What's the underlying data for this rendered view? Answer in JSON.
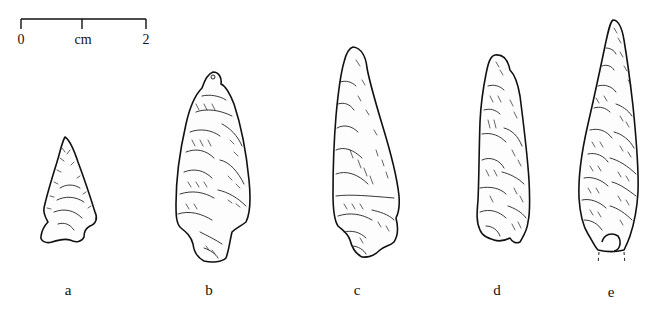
{
  "scale_bar": {
    "start_label": "0",
    "unit_label": "cm",
    "end_label": "2"
  },
  "artifacts": [
    {
      "id": "a",
      "label": "a",
      "type": "side-notched point"
    },
    {
      "id": "b",
      "label": "b",
      "type": "stemmed point"
    },
    {
      "id": "c",
      "label": "c",
      "type": "stemmed point"
    },
    {
      "id": "d",
      "label": "d",
      "type": "stemmed point"
    },
    {
      "id": "e",
      "label": "e",
      "type": "lanceolate point (broken base)"
    }
  ]
}
